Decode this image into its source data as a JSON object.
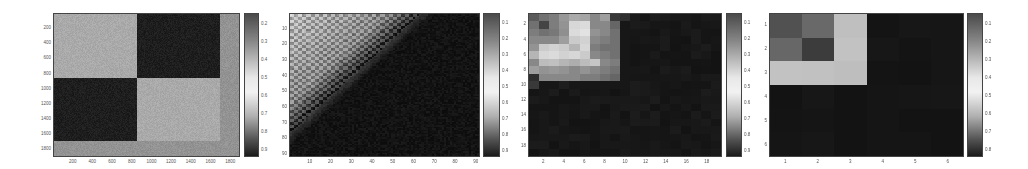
{
  "chart_data": [
    {
      "type": "heatmap",
      "title": "",
      "xlabel": "",
      "ylabel": "",
      "description": "Block-structured similarity matrix: two dark off-diagonal blocks, light diagonal blocks, light noisy border strip at right and bottom",
      "xticks": [
        "200",
        "400",
        "600",
        "800",
        "1000",
        "1200",
        "1400",
        "1600",
        "1800"
      ],
      "yticks": [
        "200",
        "400",
        "600",
        "800",
        "1000",
        "1200",
        "1400",
        "1600",
        "1800"
      ],
      "xlim": [
        0,
        1900
      ],
      "ylim": [
        0,
        1900
      ],
      "blocks": [
        {
          "rows": [
            0,
            850
          ],
          "cols": [
            0,
            850
          ],
          "value": 0.7
        },
        {
          "rows": [
            0,
            850
          ],
          "cols": [
            850,
            1700
          ],
          "value": 0.08
        },
        {
          "rows": [
            850,
            1700
          ],
          "cols": [
            0,
            850
          ],
          "value": 0.08
        },
        {
          "rows": [
            850,
            1700
          ],
          "cols": [
            850,
            1700
          ],
          "value": 0.7
        },
        {
          "rows": [
            1700,
            1900
          ],
          "cols": [
            0,
            1900
          ],
          "value": 0.6
        },
        {
          "rows": [
            0,
            1900
          ],
          "cols": [
            1700,
            1900
          ],
          "value": 0.6
        }
      ],
      "colorbar": {
        "ticks": [
          "0.2",
          "0.3",
          "0.4",
          "0.5",
          "0.6",
          "0.7",
          "0.8",
          "0.9"
        ]
      }
    },
    {
      "type": "heatmap",
      "title": "",
      "xlabel": "",
      "ylabel": "",
      "description": "Textured matrix with bright upper-left region fading diagonally to a dark lower-right region",
      "xticks": [
        "10",
        "20",
        "30",
        "40",
        "50",
        "60",
        "70",
        "80",
        "90"
      ],
      "yticks": [
        "10",
        "20",
        "30",
        "40",
        "50",
        "60",
        "70",
        "80",
        "90"
      ],
      "xlim": [
        0,
        92
      ],
      "ylim": [
        0,
        92
      ],
      "colorbar": {
        "ticks": [
          "0.1",
          "0.2",
          "0.3",
          "0.4",
          "0.5",
          "0.6",
          "0.7",
          "0.8",
          "0.9"
        ]
      }
    },
    {
      "type": "heatmap",
      "title": "",
      "xlabel": "",
      "ylabel": "",
      "description": "19x19 matrix; bright patchy block in rows 1-9, cols 1-9; near-black elsewhere",
      "xticks": [
        "2",
        "4",
        "6",
        "8",
        "10",
        "12",
        "14",
        "16",
        "18"
      ],
      "yticks": [
        "2",
        "4",
        "6",
        "8",
        "10",
        "12",
        "14",
        "16",
        "18"
      ],
      "xlim": [
        0.5,
        19.5
      ],
      "ylim": [
        0.5,
        19.5
      ],
      "bright_block": {
        "rows": [
          1,
          9
        ],
        "cols": [
          1,
          9
        ]
      },
      "matrix_topleft": [
        [
          0.35,
          0.45,
          0.5,
          0.62,
          0.7,
          0.68,
          0.55,
          0.65,
          0.2,
          0.15
        ],
        [
          0.45,
          0.25,
          0.5,
          0.6,
          0.9,
          0.92,
          0.55,
          0.55,
          0.4,
          0.05
        ],
        [
          0.5,
          0.45,
          0.48,
          0.58,
          0.92,
          0.95,
          0.6,
          0.55,
          0.45,
          0.05
        ],
        [
          0.55,
          0.55,
          0.55,
          0.65,
          0.85,
          0.88,
          0.55,
          0.5,
          0.45,
          0.05
        ],
        [
          0.6,
          0.85,
          0.88,
          0.85,
          0.75,
          0.9,
          0.5,
          0.45,
          0.45,
          0.05
        ],
        [
          0.75,
          0.9,
          0.92,
          0.88,
          0.9,
          0.85,
          0.55,
          0.5,
          0.45,
          0.05
        ],
        [
          0.55,
          0.78,
          0.8,
          0.75,
          0.72,
          0.78,
          0.82,
          0.55,
          0.5,
          0.05
        ],
        [
          0.65,
          0.6,
          0.62,
          0.6,
          0.55,
          0.6,
          0.55,
          0.5,
          0.45,
          0.05
        ],
        [
          0.15,
          0.55,
          0.55,
          0.55,
          0.55,
          0.5,
          0.5,
          0.45,
          0.4,
          0.05
        ],
        [
          0.2,
          0.05,
          0.05,
          0.08,
          0.05,
          0.05,
          0.05,
          0.05,
          0.05,
          0.05
        ]
      ],
      "colorbar": {
        "ticks": [
          "0.1",
          "0.2",
          "0.3",
          "0.4",
          "0.5",
          "0.6",
          "0.7",
          "0.8",
          "0.9"
        ]
      }
    },
    {
      "type": "heatmap",
      "title": "",
      "xlabel": "",
      "ylabel": "",
      "description": "6x6 matrix; upper-left 3x3 block non-zero, remainder near-black",
      "xticks": [
        "1",
        "2",
        "3",
        "4",
        "5",
        "6"
      ],
      "yticks": [
        "1",
        "2",
        "3",
        "4",
        "5",
        "6"
      ],
      "xlim": [
        0.5,
        6.5
      ],
      "ylim": [
        0.5,
        6.5
      ],
      "matrix": [
        [
          0.3,
          0.42,
          0.8,
          0.04,
          0.04,
          0.04
        ],
        [
          0.4,
          0.22,
          0.8,
          0.04,
          0.04,
          0.04
        ],
        [
          0.8,
          0.8,
          0.8,
          0.04,
          0.04,
          0.04
        ],
        [
          0.04,
          0.04,
          0.04,
          0.04,
          0.04,
          0.04
        ],
        [
          0.04,
          0.04,
          0.04,
          0.04,
          0.04,
          0.04
        ],
        [
          0.04,
          0.04,
          0.04,
          0.04,
          0.04,
          0.04
        ]
      ],
      "colorbar": {
        "ticks": [
          "0.1",
          "0.2",
          "0.3",
          "0.4",
          "0.5",
          "0.6",
          "0.7",
          "0.8"
        ]
      }
    }
  ],
  "layout": {
    "panels": [
      {
        "plot": [
          53,
          13,
          187,
          144
        ],
        "cbar": [
          244,
          13,
          15,
          144
        ]
      },
      {
        "plot": [
          289,
          13,
          191,
          144
        ],
        "cbar": [
          483,
          13,
          17,
          144
        ]
      },
      {
        "plot": [
          528,
          13,
          194,
          144
        ],
        "cbar": [
          726,
          13,
          16,
          144
        ]
      },
      {
        "plot": [
          769,
          13,
          195,
          144
        ],
        "cbar": [
          967,
          13,
          16,
          144
        ]
      }
    ]
  }
}
